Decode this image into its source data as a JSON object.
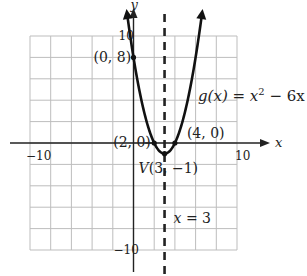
{
  "chart_data": {
    "type": "line",
    "title": "",
    "function_label": "g(x) = x² − 6x + 8",
    "function_label_parts": {
      "prefix": "g(x) = x",
      "exponent": "2",
      "suffix": " − 6x + "
    },
    "xlabel": "x",
    "ylabel": "y",
    "xlim": [
      -10,
      10
    ],
    "ylim": [
      -10,
      10
    ],
    "grid_step": 2,
    "grid": true,
    "x_ticks": [
      {
        "value": -10,
        "label": "−10"
      },
      {
        "value": 10,
        "label": "10"
      }
    ],
    "y_ticks": [
      {
        "value": 10,
        "label": "10"
      },
      {
        "value": -10,
        "label": "−10"
      }
    ],
    "series": [
      {
        "name": "g(x) = x^2 - 6x + 8",
        "coefficients": {
          "a": 1,
          "b": -6,
          "c": 8
        },
        "x_range": [
          -0.6,
          6.6
        ],
        "color": "#111111"
      }
    ],
    "axis_of_symmetry": {
      "x": 3,
      "label": "x = 3",
      "label_var": "x",
      "label_rest": " = 3",
      "style": "dashed"
    },
    "points": [
      {
        "name": "y-intercept",
        "x": 0,
        "y": 8,
        "label": "(0, 8)"
      },
      {
        "name": "x-intercept-left",
        "x": 2,
        "y": 0,
        "label": "(2, 0)"
      },
      {
        "name": "x-intercept-right",
        "x": 4,
        "y": 0,
        "label": "(4, 0)"
      },
      {
        "name": "vertex",
        "x": 3,
        "y": -1,
        "label": "V(3, −1)",
        "label_var": "V",
        "label_rest": "(3, −1)"
      }
    ],
    "colors": {
      "grid": "#bdbdbd",
      "axis": "#222222",
      "curve": "#111111",
      "text": "#222222"
    }
  }
}
